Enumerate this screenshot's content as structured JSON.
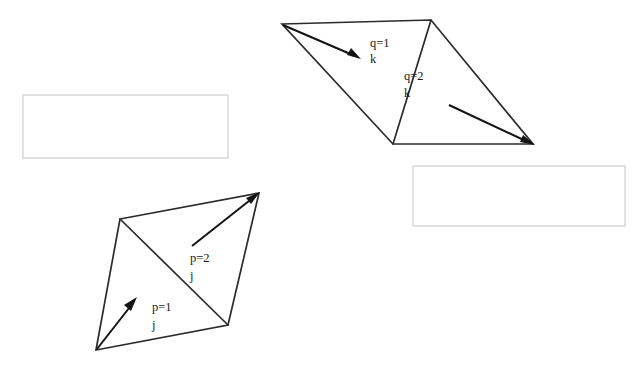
{
  "figure": {
    "background_color": "#ffffff",
    "line_color": "#2b2b2b",
    "arrow_color": "#141414",
    "box_border_color": "#c9c9c9",
    "width": 638,
    "height": 373
  },
  "upper_element": {
    "name": "upper-quadrilateral",
    "outline_points": "282,24 431,20 533,144 393,144",
    "diagonal_points": "431,20 393,144",
    "sub_triangles": [
      {
        "id": "q1",
        "label_line1": "q=1",
        "label_line2": "k",
        "label_x": 370,
        "label_y1": 47,
        "label_y2": 63,
        "arrow_line": "283,25 355,56",
        "arrow_head": "361,59 347,55 351,48"
      },
      {
        "id": "q2",
        "label_line1": "q=2",
        "label_line2": "k",
        "label_x": 404,
        "label_y1": 80,
        "label_y2": 97,
        "arrow_line": "449,105 528,142",
        "arrow_head": "535,145 520,142 523,135"
      }
    ]
  },
  "lower_element": {
    "name": "lower-quadrilateral",
    "outline_points": "120,219 259,193 228,325 96,350",
    "diagonal_points": "120,219 228,325",
    "sub_triangles": [
      {
        "id": "p1",
        "label_line1": "p=1",
        "label_line2": "j",
        "label_x": 152,
        "label_y1": 311,
        "label_y2": 329,
        "arrow_line": "97,349 133,303",
        "arrow_head": "137,297 131,311 124,305"
      },
      {
        "id": "p2",
        "label_line1": "p=2",
        "label_line2": "j",
        "label_x": 190,
        "label_y1": 262,
        "label_y2": 280,
        "arrow_line": "192,246 254,197",
        "arrow_head": "260,192 246,198 251,204"
      }
    ]
  },
  "caption_boxes": [
    {
      "id": "left-caption-box",
      "x": 23,
      "y": 95,
      "width": 205,
      "height": 63,
      "text": ""
    },
    {
      "id": "right-caption-box",
      "x": 413,
      "y": 166,
      "width": 212,
      "height": 60,
      "text": ""
    }
  ]
}
